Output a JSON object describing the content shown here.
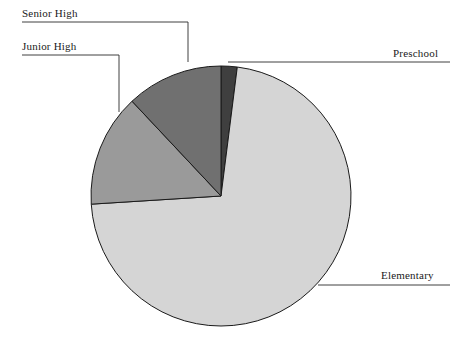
{
  "chart_data": {
    "type": "pie",
    "title": "",
    "subtitle": "",
    "xlabel": "",
    "ylabel": "",
    "grid": false,
    "legend_position": "callout-labels",
    "categories": [
      "Preschool",
      "Elementary",
      "Junior High",
      "Senior High"
    ],
    "values": [
      2,
      72,
      14,
      12
    ],
    "units": "percent",
    "colors": [
      "#3f3f3f",
      "#d5d5d5",
      "#9a9a9a",
      "#707070"
    ],
    "slices": [
      {
        "label": "Preschool",
        "value": 2,
        "color": "#3f3f3f",
        "start_angle": 0,
        "end_angle": 7.2
      },
      {
        "label": "Elementary",
        "value": 72,
        "color": "#d5d5d5",
        "start_angle": 7.2,
        "end_angle": 266.4
      },
      {
        "label": "Junior High",
        "value": 14,
        "color": "#9a9a9a",
        "start_angle": 266.4,
        "end_angle": 316.8
      },
      {
        "label": "Senior High",
        "value": 12,
        "color": "#707070",
        "start_angle": 316.8,
        "end_angle": 360
      }
    ],
    "geometry": {
      "center_x": 221,
      "center_y": 196,
      "radius": 130,
      "stroke": "#1a1a1a",
      "stroke_width": 1
    },
    "annotations": [
      {
        "name": "senior-high",
        "text": "Senior High",
        "text_x": 22,
        "text_y": 7,
        "leader": "M 22 22 L 188 22 L 188 62"
      },
      {
        "name": "junior-high",
        "text": "Junior High",
        "text_x": 22,
        "text_y": 40,
        "leader": "M 22 55 L 119 55 L 119 112"
      },
      {
        "name": "preschool",
        "text": "Preschool",
        "text_x": 393,
        "text_y": 47,
        "leader": "M 450 62 L 228 62"
      },
      {
        "name": "elementary",
        "text": "Elementary",
        "text_x": 381,
        "text_y": 269,
        "leader": "M 450 285 L 318 285"
      }
    ]
  },
  "labels": {
    "senior_high": "Senior High",
    "junior_high": "Junior High",
    "preschool": "Preschool",
    "elementary": "Elementary"
  },
  "colors": {
    "preschool": "#3f3f3f",
    "elementary": "#d5d5d5",
    "junior_high": "#9a9a9a",
    "senior_high": "#707070",
    "outline": "#1a1a1a",
    "background": "#ffffff",
    "leader_line": "#2a2a2a"
  }
}
